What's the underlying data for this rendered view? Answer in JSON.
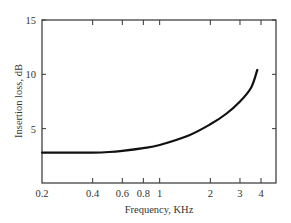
{
  "chart_data": {
    "type": "line",
    "title": "",
    "xlabel": "Frequency, KHz",
    "ylabel": "Insertion loss, dB",
    "xscale": "log",
    "xlim": [
      0.2,
      4.5
    ],
    "ylim": [
      0,
      15
    ],
    "x_ticks": [
      0.2,
      0.4,
      0.6,
      0.8,
      1,
      2,
      3,
      4
    ],
    "x_tick_labels": [
      "0.2",
      "0.4",
      "0.6",
      "0.8",
      "1",
      "2",
      "3",
      "4"
    ],
    "y_ticks": [
      5,
      10,
      15
    ],
    "y_tick_labels": [
      "5",
      "10",
      "15"
    ],
    "grid": false,
    "legend": null,
    "series": [
      {
        "name": "Insertion loss",
        "x": [
          0.2,
          0.3,
          0.4,
          0.5,
          0.6,
          0.8,
          1.0,
          1.5,
          2.0,
          2.5,
          3.0,
          3.5,
          3.8
        ],
        "values": [
          2.8,
          2.8,
          2.8,
          2.85,
          2.95,
          3.2,
          3.5,
          4.4,
          5.4,
          6.4,
          7.5,
          8.8,
          10.4
        ]
      }
    ],
    "colors": {
      "line": "#111111",
      "axes": "#333333"
    }
  }
}
